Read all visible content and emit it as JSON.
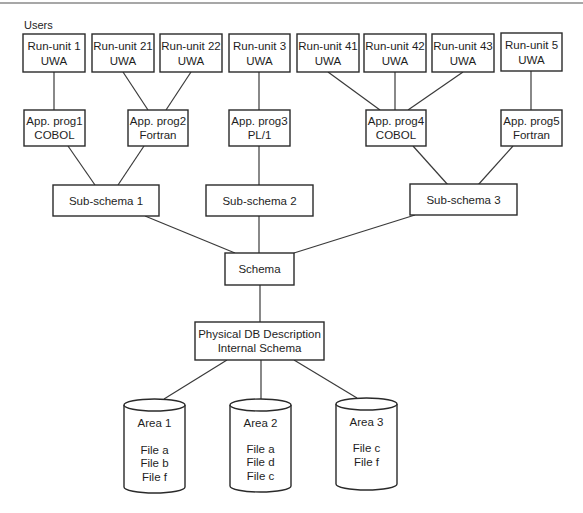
{
  "diagram": {
    "title": "Users",
    "run_units": [
      {
        "name": "Run-unit 1",
        "sub": "UWA"
      },
      {
        "name": "Run-unit 21",
        "sub": "UWA"
      },
      {
        "name": "Run-unit 22",
        "sub": "UWA"
      },
      {
        "name": "Run-unit 3",
        "sub": "UWA"
      },
      {
        "name": "Run-unit 41",
        "sub": "UWA"
      },
      {
        "name": "Run-unit 42",
        "sub": "UWA"
      },
      {
        "name": "Run-unit 43",
        "sub": "UWA"
      },
      {
        "name": "Run-unit 5",
        "sub": "UWA"
      }
    ],
    "app_programs": [
      {
        "name": "App. prog1",
        "language": "COBOL"
      },
      {
        "name": "App. prog2",
        "language": "Fortran"
      },
      {
        "name": "App. prog3",
        "language": "PL/1"
      },
      {
        "name": "App. prog4",
        "language": "COBOL"
      },
      {
        "name": "App. prog5",
        "language": "Fortran"
      }
    ],
    "sub_schemas": [
      {
        "name": "Sub-schema 1"
      },
      {
        "name": "Sub-schema 2"
      },
      {
        "name": "Sub-schema 3"
      }
    ],
    "schema": {
      "name": "Schema"
    },
    "physical": {
      "line1": "Physical DB Description",
      "line2": "Internal Schema"
    },
    "areas": [
      {
        "name": "Area 1",
        "files": [
          "File a",
          "File b",
          "File f"
        ]
      },
      {
        "name": "Area 2",
        "files": [
          "File a",
          "File d",
          "File c"
        ]
      },
      {
        "name": "Area 3",
        "files": [
          "File c",
          "File f"
        ]
      }
    ],
    "connections": [
      [
        "Run-unit 1",
        "App. prog1"
      ],
      [
        "Run-unit 21",
        "App. prog2"
      ],
      [
        "Run-unit 22",
        "App. prog2"
      ],
      [
        "Run-unit 3",
        "App. prog3"
      ],
      [
        "Run-unit 41",
        "App. prog4"
      ],
      [
        "Run-unit 42",
        "App. prog4"
      ],
      [
        "Run-unit 43",
        "App. prog4"
      ],
      [
        "Run-unit 5",
        "App. prog5"
      ],
      [
        "App. prog1",
        "Sub-schema 1"
      ],
      [
        "App. prog2",
        "Sub-schema 1"
      ],
      [
        "App. prog3",
        "Sub-schema 2"
      ],
      [
        "App. prog4",
        "Sub-schema 3"
      ],
      [
        "App. prog5",
        "Sub-schema 3"
      ],
      [
        "Sub-schema 1",
        "Schema"
      ],
      [
        "Sub-schema 2",
        "Schema"
      ],
      [
        "Sub-schema 3",
        "Schema"
      ],
      [
        "Schema",
        "Physical DB Description"
      ],
      [
        "Physical DB Description",
        "Area 1"
      ],
      [
        "Physical DB Description",
        "Area 2"
      ],
      [
        "Physical DB Description",
        "Area 3"
      ]
    ],
    "colors": {
      "stroke": "#2a2a2a",
      "text": "#1e1e1e",
      "rule": "#8a8a8a",
      "background": "#ffffff"
    }
  }
}
